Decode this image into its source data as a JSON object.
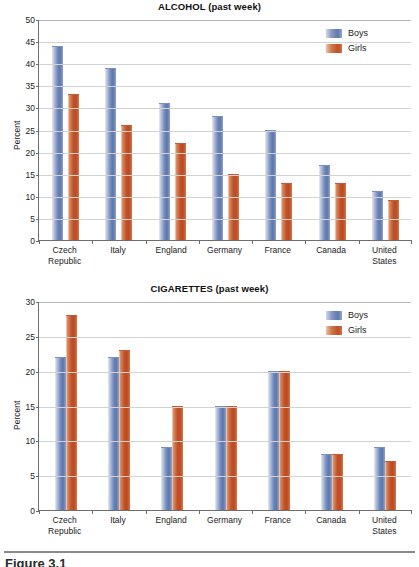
{
  "figure": {
    "caption": "Figure 3.1",
    "categories": [
      "Czech Republic",
      "Italy",
      "England",
      "Germany",
      "France",
      "Canada",
      "United States"
    ],
    "category_lines": [
      [
        "Czech",
        "Republic"
      ],
      [
        "Italy"
      ],
      [
        "England"
      ],
      [
        "Germany"
      ],
      [
        "France"
      ],
      [
        "Canada"
      ],
      [
        "United",
        "States"
      ]
    ],
    "legend": [
      {
        "name": "Boys",
        "color": "#6f87b8"
      },
      {
        "name": "Girls",
        "color": "#c2522a"
      }
    ]
  },
  "colors": {
    "boys": "#6f87b8",
    "girls": "#c2522a",
    "axis": "#6e6e6e",
    "grid": "#d2d2d2",
    "background": "#ffffff",
    "text": "#1a1a1a"
  },
  "chart_data": [
    {
      "type": "bar",
      "id": "alcohol",
      "title": "ALCOHOL (past week)",
      "xlabel": "",
      "ylabel": "Percent",
      "ylim": [
        0,
        50
      ],
      "yticks": [
        0,
        5,
        10,
        15,
        20,
        25,
        30,
        35,
        40,
        45,
        50
      ],
      "grid": true,
      "legend_position": "top-right",
      "categories": [
        "Czech Republic",
        "Italy",
        "England",
        "Germany",
        "France",
        "Canada",
        "United States"
      ],
      "series": [
        {
          "name": "Boys",
          "color": "#6f87b8",
          "values": [
            44,
            39,
            31,
            28,
            25,
            17,
            11
          ]
        },
        {
          "name": "Girls",
          "color": "#c2522a",
          "values": [
            33,
            26,
            22,
            15,
            13,
            13,
            9
          ]
        }
      ]
    },
    {
      "type": "bar",
      "id": "cigarettes",
      "title": "CIGARETTES (past week)",
      "xlabel": "",
      "ylabel": "Percent",
      "ylim": [
        0,
        30
      ],
      "yticks": [
        0,
        5,
        10,
        15,
        20,
        25,
        30
      ],
      "grid": true,
      "legend_position": "top-right",
      "categories": [
        "Czech Republic",
        "Italy",
        "England",
        "Germany",
        "France",
        "Canada",
        "United States"
      ],
      "series": [
        {
          "name": "Boys",
          "color": "#6f87b8",
          "values": [
            22,
            22,
            9,
            15,
            20,
            8,
            9
          ]
        },
        {
          "name": "Girls",
          "color": "#c2522a",
          "values": [
            28,
            23,
            15,
            15,
            20,
            8,
            7
          ]
        }
      ]
    }
  ]
}
